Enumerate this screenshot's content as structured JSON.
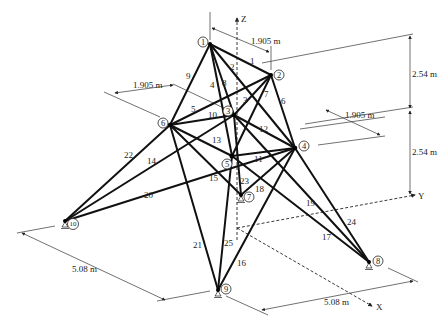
{
  "axes": {
    "x": "X",
    "y": "Y",
    "z": "Z"
  },
  "dimensions": {
    "d1": "1.905 m",
    "d2": "1.905 m",
    "d3": "1.905 m",
    "h1": "2.54 m",
    "h2": "2.54 m",
    "w1": "5.08 m",
    "w2": "5.08 m"
  },
  "nodes": [
    {
      "id": "1",
      "x": 210,
      "y": 44
    },
    {
      "id": "2",
      "x": 271,
      "y": 75
    },
    {
      "id": "3",
      "x": 234,
      "y": 115
    },
    {
      "id": "4",
      "x": 295,
      "y": 148
    },
    {
      "id": "5",
      "x": 232,
      "y": 156
    },
    {
      "id": "6",
      "x": 170,
      "y": 125
    },
    {
      "id": "7",
      "x": 241,
      "y": 195
    },
    {
      "id": "8",
      "x": 369,
      "y": 262
    },
    {
      "id": "9",
      "x": 218,
      "y": 290
    },
    {
      "id": "10",
      "x": 65,
      "y": 221
    }
  ],
  "members": [
    {
      "id": "1",
      "from": "1",
      "to": "2"
    },
    {
      "id": "2",
      "from": "1",
      "to": "4"
    },
    {
      "id": "3",
      "from": "2",
      "to": "3"
    },
    {
      "id": "4",
      "from": "1",
      "to": "5"
    },
    {
      "id": "5",
      "from": "2",
      "to": "6"
    },
    {
      "id": "6",
      "from": "2",
      "to": "4"
    },
    {
      "id": "7",
      "from": "2",
      "to": "5"
    },
    {
      "id": "8",
      "from": "1",
      "to": "3"
    },
    {
      "id": "9",
      "from": "1",
      "to": "6"
    },
    {
      "id": "10",
      "from": "3",
      "to": "6"
    },
    {
      "id": "11",
      "from": "4",
      "to": "5"
    },
    {
      "id": "12",
      "from": "3",
      "to": "4"
    },
    {
      "id": "13",
      "from": "5",
      "to": "6"
    },
    {
      "id": "14",
      "from": "3",
      "to": "10"
    },
    {
      "id": "15",
      "from": "6",
      "to": "7"
    },
    {
      "id": "16",
      "from": "4",
      "to": "9"
    },
    {
      "id": "17",
      "from": "5",
      "to": "8"
    },
    {
      "id": "18",
      "from": "4",
      "to": "7"
    },
    {
      "id": "19",
      "from": "3",
      "to": "8"
    },
    {
      "id": "20",
      "from": "4",
      "to": "10"
    },
    {
      "id": "21",
      "from": "6",
      "to": "9"
    },
    {
      "id": "22",
      "from": "6",
      "to": "10"
    },
    {
      "id": "23",
      "from": "3",
      "to": "7"
    },
    {
      "id": "24",
      "from": "4",
      "to": "8"
    },
    {
      "id": "25",
      "from": "5",
      "to": "9"
    }
  ]
}
